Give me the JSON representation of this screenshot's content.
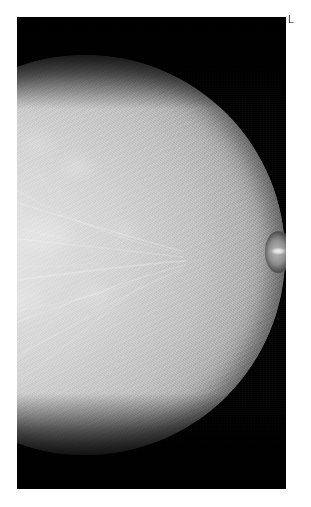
{
  "study": {
    "modality": "mammogram",
    "view_description": "left breast, nipple in profile",
    "laterality_marker": "L"
  },
  "film": {
    "background_color": "#000000",
    "panel_left": 17,
    "panel_top": 17,
    "panel_width": 269,
    "panel_height": 472
  },
  "anatomy": {
    "nipple_label": "nipple",
    "parenchyma_label": "fibroglandular tissue",
    "skin_line_label": "skin line",
    "vasculature_label": "vascular and ductal strands"
  },
  "colors": {
    "page_background": "#ffffff",
    "film_background": "#000000",
    "tissue_bright": "#e8e8e8",
    "tissue_mid": "#c2c2c2",
    "tissue_dark": "#3f3f3f",
    "marker_text": "#4a4a4a"
  }
}
